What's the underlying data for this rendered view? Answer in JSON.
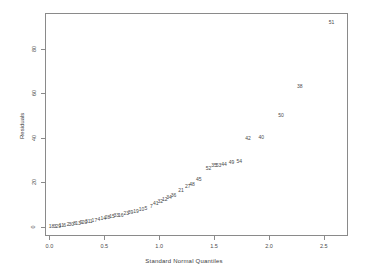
{
  "chart_data": {
    "type": "scatter",
    "title": "",
    "subtitle": "",
    "xlabel": "Standard Normal Quantiles",
    "ylabel": "Residuals",
    "xlim": [
      -0.04,
      2.72
    ],
    "ylim": [
      -4,
      96
    ],
    "xticks": [
      "0.0",
      "0.5",
      "1.0",
      "1.5",
      "2.0",
      "2.5"
    ],
    "xtick_values": [
      0.0,
      0.5,
      1.0,
      1.5,
      2.0,
      2.5
    ],
    "yticks": [
      "0",
      "20",
      "40",
      "60",
      "80"
    ],
    "ytick_values": [
      0,
      20,
      40,
      60,
      80
    ],
    "grid": false,
    "legend": "none",
    "marker_style": "text-labels",
    "note": "Normal Q-Q plot of residuals; each point is drawn as its case-number label",
    "points": [
      {
        "label": "18",
        "x": 0.02,
        "y": 0.3
      },
      {
        "label": "3",
        "x": 0.05,
        "y": 0.5
      },
      {
        "label": "29",
        "x": 0.08,
        "y": 0.7
      },
      {
        "label": "11",
        "x": 0.11,
        "y": 0.9
      },
      {
        "label": "6",
        "x": 0.14,
        "y": 1.1
      },
      {
        "label": "2",
        "x": 0.17,
        "y": 1.3
      },
      {
        "label": "30",
        "x": 0.2,
        "y": 1.5
      },
      {
        "label": "8",
        "x": 0.23,
        "y": 1.7
      },
      {
        "label": "13",
        "x": 0.26,
        "y": 1.9
      },
      {
        "label": "9",
        "x": 0.29,
        "y": 2.1
      },
      {
        "label": "20",
        "x": 0.32,
        "y": 2.3
      },
      {
        "label": "31",
        "x": 0.35,
        "y": 2.6
      },
      {
        "label": "1",
        "x": 0.38,
        "y": 2.9
      },
      {
        "label": "17",
        "x": 0.41,
        "y": 3.2
      },
      {
        "label": "4",
        "x": 0.45,
        "y": 3.6
      },
      {
        "label": "14",
        "x": 0.49,
        "y": 4.0
      },
      {
        "label": "28",
        "x": 0.53,
        "y": 4.4
      },
      {
        "label": "15",
        "x": 0.57,
        "y": 4.8
      },
      {
        "label": "33",
        "x": 0.61,
        "y": 5.2
      },
      {
        "label": "16",
        "x": 0.65,
        "y": 5.6
      },
      {
        "label": "23",
        "x": 0.7,
        "y": 6.1
      },
      {
        "label": "39",
        "x": 0.74,
        "y": 6.6
      },
      {
        "label": "19",
        "x": 0.79,
        "y": 7.2
      },
      {
        "label": "10",
        "x": 0.84,
        "y": 7.9
      },
      {
        "label": "5",
        "x": 0.88,
        "y": 8.5
      },
      {
        "label": "7",
        "x": 0.93,
        "y": 9.6
      },
      {
        "label": "41",
        "x": 0.97,
        "y": 10.8
      },
      {
        "label": "32",
        "x": 1.01,
        "y": 11.8
      },
      {
        "label": "12",
        "x": 1.05,
        "y": 12.8
      },
      {
        "label": "34",
        "x": 1.09,
        "y": 13.6
      },
      {
        "label": "36",
        "x": 1.13,
        "y": 14.6
      },
      {
        "label": "21",
        "x": 1.2,
        "y": 16.6
      },
      {
        "label": "27",
        "x": 1.26,
        "y": 18.4
      },
      {
        "label": "48",
        "x": 1.3,
        "y": 19.2
      },
      {
        "label": "45",
        "x": 1.36,
        "y": 21.6
      },
      {
        "label": "52",
        "x": 1.45,
        "y": 26.4
      },
      {
        "label": "35",
        "x": 1.5,
        "y": 27.8
      },
      {
        "label": "53",
        "x": 1.54,
        "y": 28.0
      },
      {
        "label": "44",
        "x": 1.59,
        "y": 28.2
      },
      {
        "label": "49",
        "x": 1.66,
        "y": 29.0
      },
      {
        "label": "54",
        "x": 1.73,
        "y": 29.6
      },
      {
        "label": "42",
        "x": 1.81,
        "y": 39.8
      },
      {
        "label": "40",
        "x": 1.93,
        "y": 40.4
      },
      {
        "label": "50",
        "x": 2.11,
        "y": 50.4
      },
      {
        "label": "38",
        "x": 2.28,
        "y": 63.2
      },
      {
        "label": "51",
        "x": 2.57,
        "y": 91.8
      }
    ]
  }
}
